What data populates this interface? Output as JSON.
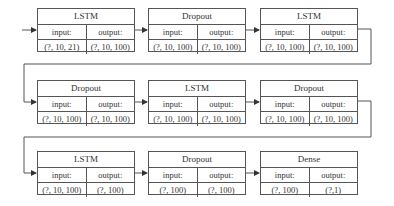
{
  "diagram": {
    "type": "neural-network-layer-flow",
    "labels": {
      "input": "input:",
      "output": "output:"
    },
    "layers": [
      {
        "name": "LSTM",
        "input": "(?, 10, 21)",
        "output": "(?, 10, 100)"
      },
      {
        "name": "Dropout",
        "input": "(?, 10, 100)",
        "output": "(?, 10, 100)"
      },
      {
        "name": "LSTM",
        "input": "(?, 10, 100)",
        "output": "(?, 10, 100)"
      },
      {
        "name": "Dropout",
        "input": "(?, 10, 100)",
        "output": "(?, 10, 100)"
      },
      {
        "name": "LSTM",
        "input": "(?, 10, 100)",
        "output": "(?, 10, 100)"
      },
      {
        "name": "Dropout",
        "input": "(?, 10, 100)",
        "output": "(?, 10, 100)"
      },
      {
        "name": "LSTM",
        "input": "(?, 10, 100)",
        "output": "(?, 100)"
      },
      {
        "name": "Dropout",
        "input": "(?, 100)",
        "output": "(?, 100)"
      },
      {
        "name": "Dense",
        "input": "(?, 100)",
        "output": "(?,1)"
      }
    ]
  }
}
